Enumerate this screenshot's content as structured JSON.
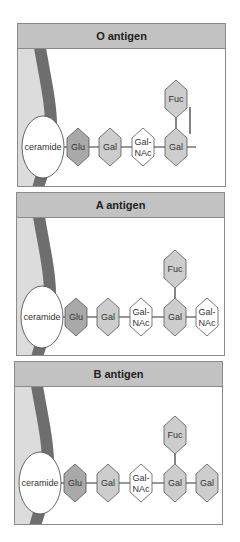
{
  "colors": {
    "header_bg": "#c2c2c2",
    "membrane_outer": "#dcdcdc",
    "membrane_band": "#6e6e6e",
    "hex_dark": "#a9a9a9",
    "hex_medium": "#cdcdcd",
    "hex_white": "#ffffff",
    "line": "#333333"
  },
  "panels": [
    {
      "title": "O antigen",
      "anchor": "ceramide",
      "chain": [
        {
          "label": "Glu",
          "shade": "dark"
        },
        {
          "label": "Gal",
          "shade": "medium"
        },
        {
          "label": "Gal-\nNAc",
          "line1": "Gal-",
          "line2": "NAc",
          "shade": "white"
        },
        {
          "label": "Gal",
          "shade": "medium"
        }
      ],
      "branch": {
        "label": "Fuc",
        "attached_to_index": 3,
        "shade": "medium"
      }
    },
    {
      "title": "A antigen",
      "anchor": "ceramide",
      "chain": [
        {
          "label": "Glu",
          "shade": "dark"
        },
        {
          "label": "Gal",
          "shade": "medium"
        },
        {
          "label": "Gal-\nNAc",
          "line1": "Gal-",
          "line2": "NAc",
          "shade": "white"
        },
        {
          "label": "Gal",
          "shade": "medium"
        },
        {
          "label": "Gal-\nNAc",
          "line1": "Gal-",
          "line2": "NAc",
          "shade": "white"
        }
      ],
      "branch": {
        "label": "Fuc",
        "attached_to_index": 3,
        "shade": "medium"
      }
    },
    {
      "title": "B antigen",
      "anchor": "ceramide",
      "chain": [
        {
          "label": "Glu",
          "shade": "dark"
        },
        {
          "label": "Gal",
          "shade": "medium"
        },
        {
          "label": "Gal-\nNAc",
          "line1": "Gal-",
          "line2": "NAc",
          "shade": "white"
        },
        {
          "label": "Gal",
          "shade": "medium"
        },
        {
          "label": "Gal",
          "shade": "medium"
        }
      ],
      "branch": {
        "label": "Fuc",
        "attached_to_index": 3,
        "shade": "medium"
      }
    }
  ]
}
